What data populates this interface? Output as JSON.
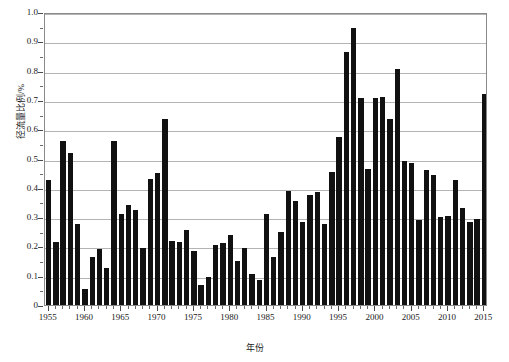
{
  "chart_data": {
    "type": "bar",
    "title": "",
    "xlabel": "年份",
    "ylabel": "径流量比例/%",
    "xlim": [
      1954.5,
      2015.5
    ],
    "ylim": [
      0,
      1.0
    ],
    "yticks": [
      "0",
      "0.1",
      "0.2",
      "0.3",
      "0.4",
      "0.5",
      "0.6",
      "0.7",
      "0.8",
      "0.9",
      "1.0"
    ],
    "ytick_values": [
      0,
      0.1,
      0.2,
      0.3,
      0.4,
      0.5,
      0.6,
      0.7,
      0.8,
      0.9,
      1.0
    ],
    "ytick_minor_step": 0.05,
    "xticks": [
      "1955",
      "1960",
      "1965",
      "1970",
      "1975",
      "1980",
      "1985",
      "1990",
      "1995",
      "2000",
      "2005",
      "2010",
      "2015"
    ],
    "xtick_values": [
      1955,
      1960,
      1965,
      1970,
      1975,
      1980,
      1985,
      1990,
      1995,
      2000,
      2005,
      2010,
      2015
    ],
    "xtick_minor_step": 1,
    "grid": "horizontal",
    "legend": null,
    "bar_color": "#111111",
    "grid_color": "#b4b4b4",
    "axis_color": "#8a8a8a",
    "categories": [
      1955,
      1956,
      1957,
      1958,
      1959,
      1960,
      1961,
      1962,
      1963,
      1964,
      1965,
      1966,
      1967,
      1968,
      1969,
      1970,
      1971,
      1972,
      1973,
      1974,
      1975,
      1976,
      1977,
      1978,
      1979,
      1980,
      1981,
      1982,
      1983,
      1984,
      1985,
      1986,
      1987,
      1988,
      1989,
      1990,
      1991,
      1992,
      1993,
      1994,
      1995,
      1996,
      1997,
      1998,
      1999,
      2000,
      2001,
      2002,
      2003,
      2004,
      2005,
      2006,
      2007,
      2008,
      2009,
      2010,
      2011,
      2012,
      2013,
      2014,
      2015
    ],
    "values": [
      0.425,
      0.215,
      0.56,
      0.52,
      0.275,
      0.055,
      0.165,
      0.19,
      0.125,
      0.56,
      0.31,
      0.34,
      0.325,
      0.195,
      0.43,
      0.45,
      0.635,
      0.22,
      0.215,
      0.255,
      0.185,
      0.07,
      0.095,
      0.205,
      0.21,
      0.24,
      0.15,
      0.195,
      0.105,
      0.085,
      0.31,
      0.165,
      0.25,
      0.39,
      0.355,
      0.285,
      0.375,
      0.385,
      0.275,
      0.455,
      0.575,
      0.865,
      0.945,
      0.705,
      0.465,
      0.705,
      0.71,
      0.635,
      0.805,
      0.49,
      0.485,
      0.29,
      0.46,
      0.445,
      0.3,
      0.305,
      0.425,
      0.33,
      0.285,
      0.295,
      0.72
    ]
  }
}
